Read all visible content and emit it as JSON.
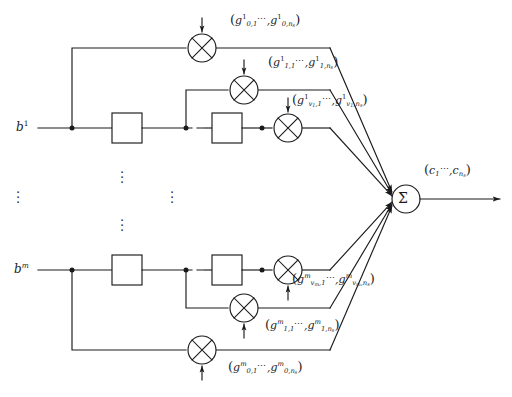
{
  "diagram": {
    "stroke_color": "#1a1a1a",
    "background": "#ffffff",
    "inputs": [
      {
        "name": "input-b-1",
        "base": "b",
        "superscript": "1"
      },
      {
        "name": "input-b-m",
        "base": "b",
        "superscript": "m"
      }
    ],
    "sum_node": {
      "symbol": "Σ",
      "label": "summation-node"
    },
    "multiplier_symbol": "⊗",
    "ellipsis_inline": "⋯",
    "vertical_ellipsis": "⋮",
    "gain_labels": [
      {
        "id": "gain-top-tap0",
        "open": "(",
        "close": ")",
        "sep": ",",
        "first": {
          "base": "g",
          "sup": "1",
          "sub_row": "0",
          "sub_col": "1"
        },
        "last": {
          "base": "g",
          "sup": "1",
          "sub_row": "0",
          "sub_col": "n",
          "sub_col_sub": "s"
        },
        "text": "(g¹₀,₁, ⋯ , g¹₀,ₙₛ)"
      },
      {
        "id": "gain-top-tap1",
        "open": "(",
        "close": ")",
        "sep": ",",
        "first": {
          "base": "g",
          "sup": "1",
          "sub_row": "1",
          "sub_col": "1"
        },
        "last": {
          "base": "g",
          "sup": "1",
          "sub_row": "1",
          "sub_col": "n",
          "sub_col_sub": "s"
        },
        "text": "(g¹₁,₁, ⋯ , g¹₁,ₙₛ)"
      },
      {
        "id": "gain-top-tapv1",
        "open": "(",
        "close": ")",
        "sep": ",",
        "first": {
          "base": "g",
          "sup": "1",
          "sub_row": "v",
          "sub_row_sub": "1",
          "sub_col": "1"
        },
        "last": {
          "base": "g",
          "sup": "1",
          "sub_row": "v",
          "sub_row_sub": "1",
          "sub_col": "n",
          "sub_col_sub": "s"
        },
        "text": "(g¹_{v₁,1}, ⋯ , g¹_{v₁,nₛ})"
      },
      {
        "id": "gain-bottom-tapvm",
        "open": "(",
        "close": ")",
        "sep": ",",
        "first": {
          "base": "g",
          "sup": "m",
          "sub_row": "v",
          "sub_row_sub": "m",
          "sub_col": "1"
        },
        "last": {
          "base": "g",
          "sup": "m",
          "sub_row": "v",
          "sub_row_sub": "m",
          "sub_col": "n",
          "sub_col_sub": "s"
        },
        "text": "(g^m_{v_m,1}, ⋯ , g^m_{v_m,nₛ})"
      },
      {
        "id": "gain-bottom-tap1",
        "open": "(",
        "close": ")",
        "sep": ",",
        "first": {
          "base": "g",
          "sup": "m",
          "sub_row": "1",
          "sub_col": "1"
        },
        "last": {
          "base": "g",
          "sup": "m",
          "sub_row": "1",
          "sub_col": "n",
          "sub_col_sub": "s"
        },
        "text": "(g^m₁,₁, ⋯ , g^m₁,ₙₛ)"
      },
      {
        "id": "gain-bottom-tap0",
        "open": "(",
        "close": ")",
        "sep": ",",
        "first": {
          "base": "g",
          "sup": "m",
          "sub_row": "0",
          "sub_col": "1"
        },
        "last": {
          "base": "g",
          "sup": "m",
          "sub_row": "0",
          "sub_col": "n",
          "sub_col_sub": "s"
        },
        "text": "(g^m₀,₁, ⋯ , g^m₀,ₙₛ)"
      }
    ],
    "output": {
      "id": "output-c",
      "open": "(",
      "close": ")",
      "sep": ",",
      "first": {
        "base": "c",
        "sub": "1"
      },
      "last": {
        "base": "c",
        "sub": "n",
        "sub_sub": "s"
      },
      "text": "(c₁, ⋯ , cₙₛ)"
    },
    "delay_boxes": [
      {
        "id": "delay-top-1"
      },
      {
        "id": "delay-top-2"
      },
      {
        "id": "delay-bottom-1"
      },
      {
        "id": "delay-bottom-2"
      }
    ]
  }
}
